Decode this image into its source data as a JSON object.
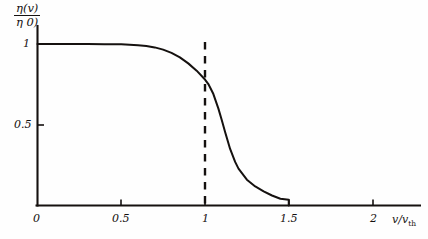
{
  "figure": {
    "background": "#fefefe",
    "ink_color": "#15110f"
  },
  "axis_labels": {
    "y_numerator": "η(v)",
    "y_denominator": "η 0)",
    "x_label_main": "v/v",
    "x_label_sub": "th"
  },
  "chart_data": {
    "type": "line",
    "title": "",
    "xlabel": "v/v_th",
    "ylabel": "η(v)/η(0)",
    "xlim": [
      0,
      2.2
    ],
    "ylim": [
      0,
      1.06
    ],
    "grid": false,
    "legend": null,
    "xticks": [
      0,
      0.5,
      1,
      1.5,
      2
    ],
    "xticklabels": [
      "0",
      "0.5",
      "1",
      "1.5",
      "2"
    ],
    "yticks": [
      0.5,
      1
    ],
    "yticklabels": [
      "0.5",
      "1"
    ],
    "annotations": [
      {
        "name": "threshold-line",
        "type": "vline",
        "x": 1,
        "style": "dashed",
        "y_from": 0,
        "y_to": 1.02
      }
    ],
    "series": [
      {
        "name": "eta-ratio",
        "style": "solid",
        "x": [
          0.0,
          0.1,
          0.2,
          0.3,
          0.4,
          0.5,
          0.55,
          0.6,
          0.65,
          0.7,
          0.75,
          0.8,
          0.85,
          0.9,
          0.95,
          1.0,
          1.02,
          1.05,
          1.08,
          1.1,
          1.12,
          1.15,
          1.18,
          1.2,
          1.25,
          1.3,
          1.35,
          1.4,
          1.45,
          1.5,
          1.5
        ],
        "y": [
          1.0,
          1.0,
          1.0,
          1.0,
          0.999,
          0.998,
          0.996,
          0.993,
          0.988,
          0.979,
          0.965,
          0.945,
          0.917,
          0.88,
          0.835,
          0.78,
          0.752,
          0.69,
          0.6,
          0.53,
          0.455,
          0.35,
          0.27,
          0.228,
          0.16,
          0.118,
          0.088,
          0.062,
          0.042,
          0.035,
          0.0
        ]
      }
    ]
  }
}
